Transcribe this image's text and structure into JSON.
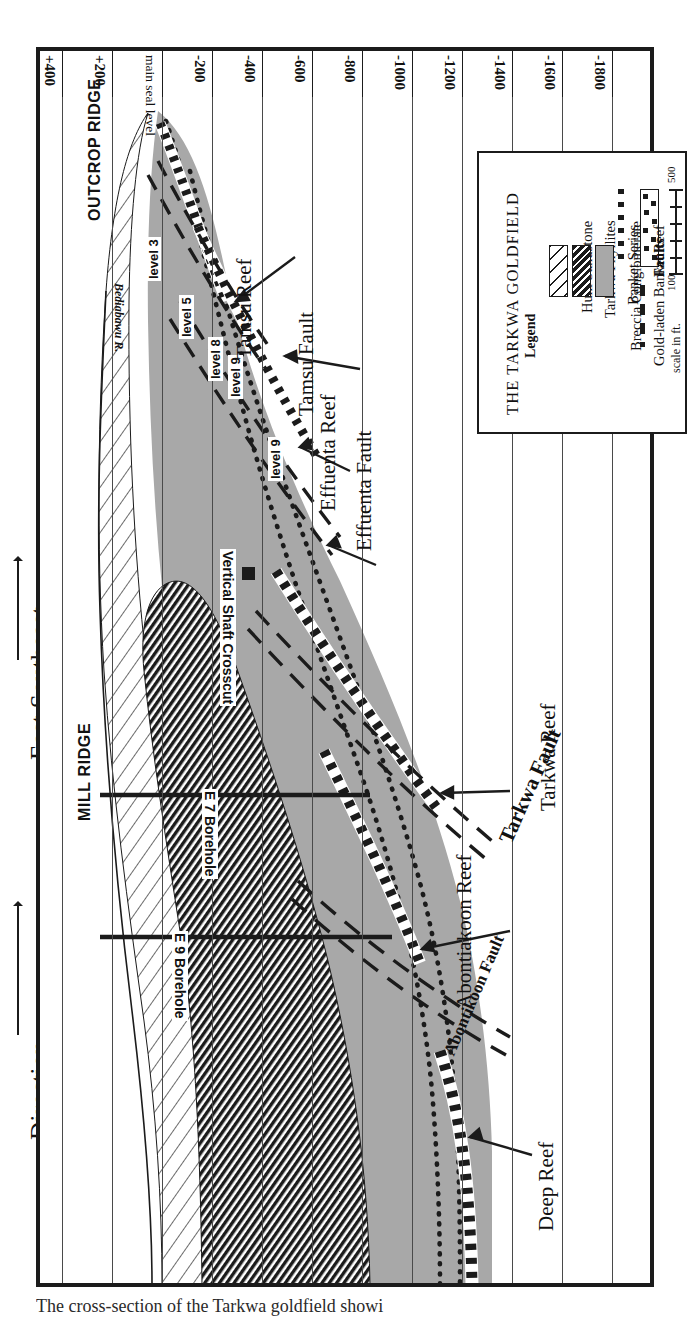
{
  "figure": {
    "title_left": "Direction",
    "subtitle_left": "East Southeast",
    "caption": "The cross-section of the Tarkwa goldfield showi"
  },
  "axis": {
    "name": "elevation-axis",
    "unit": "ft",
    "ticks": [
      {
        "label": "+400",
        "value": 400
      },
      {
        "label": "+200",
        "value": 200
      },
      {
        "label": "main seal level",
        "value": 0
      },
      {
        "label": "-200",
        "value": -200
      },
      {
        "label": "-400",
        "value": -400
      },
      {
        "label": "-600",
        "value": -600
      },
      {
        "label": "-800",
        "value": -800
      },
      {
        "label": "-1000",
        "value": -1000
      },
      {
        "label": "-1200",
        "value": -1200
      },
      {
        "label": "-1400",
        "value": -1400
      },
      {
        "label": "-1600",
        "value": -1600
      },
      {
        "label": "-1800",
        "value": -1800
      }
    ]
  },
  "surface_labels": [
    {
      "name": "outcrop-ridge",
      "text": "OUTCROP RIDGE"
    },
    {
      "name": "mill-ridge",
      "text": "MILL RIDGE"
    },
    {
      "name": "river",
      "text": "Bediabawu R."
    }
  ],
  "mine_levels": [
    {
      "name": "level-3",
      "text": "level 3"
    },
    {
      "name": "main-seal-level",
      "text": "main seal level"
    },
    {
      "name": "level-5",
      "text": "level 5"
    },
    {
      "name": "level-8",
      "text": "level 8"
    },
    {
      "name": "level-9a",
      "text": "level 9"
    },
    {
      "name": "level-9b",
      "text": "level 9"
    }
  ],
  "features": [
    {
      "name": "tamsu-reef",
      "text": "Tamsu Reef",
      "kind": "reef"
    },
    {
      "name": "tamsu-fault",
      "text": "Tamsu Fault",
      "kind": "fault"
    },
    {
      "name": "effuenta-reef",
      "text": "Effuenta Reef",
      "kind": "reef"
    },
    {
      "name": "effuenta-fault",
      "text": "Effuenta Fault",
      "kind": "fault"
    },
    {
      "name": "tarkwa-reef",
      "text": "Tarkwa Reef",
      "kind": "reef"
    },
    {
      "name": "tarkwa-fault",
      "text": "Tarkwa Fault",
      "kind": "fault"
    },
    {
      "name": "abontiakoon-reef",
      "text": "Abontiakoon Reef",
      "kind": "reef"
    },
    {
      "name": "abontikoon-fault",
      "text": "Abontikoon Fault",
      "kind": "fault"
    },
    {
      "name": "deep-reef",
      "text": "Deep Reef",
      "kind": "reef"
    }
  ],
  "workings": [
    {
      "name": "vertical-shaft-crosscut",
      "text": "Vertical Shaft Crosscut"
    },
    {
      "name": "e7-borehole",
      "text": "E 7 Borehole"
    },
    {
      "name": "e9-borehole",
      "text": "E 9 Borehole"
    }
  ],
  "legend": {
    "title": "THE TARKWA GOLDFIELD",
    "subtitle": "Legend",
    "items": [
      {
        "name": "huni-sandstone",
        "label": "Huni Sandstone",
        "style": "diagonal-hatch-light"
      },
      {
        "name": "tarkwa-phyllites",
        "label": "Tarkwa Phyllites",
        "style": "diagonal-hatch-dark"
      },
      {
        "name": "banket-series",
        "label": "Banket Series",
        "style": "solid-gray",
        "color": "#a8a8a8"
      },
      {
        "name": "breccia-conglomerate",
        "label": "Breccia Conglomerate",
        "style": "dotted-line"
      },
      {
        "name": "gold-laden-banket-reef",
        "label": "Gold-laden Banket Reef",
        "style": "checkered-band"
      },
      {
        "name": "faults",
        "label": "Faults",
        "style": "dashed-line"
      }
    ],
    "scale": {
      "caption": "scale in ft.",
      "min_label": "100",
      "max_label": "500"
    }
  },
  "colors": {
    "banket_gray": "#a8a8a8",
    "ink": "#1b1b1b",
    "grid": "#4a4a4a"
  }
}
